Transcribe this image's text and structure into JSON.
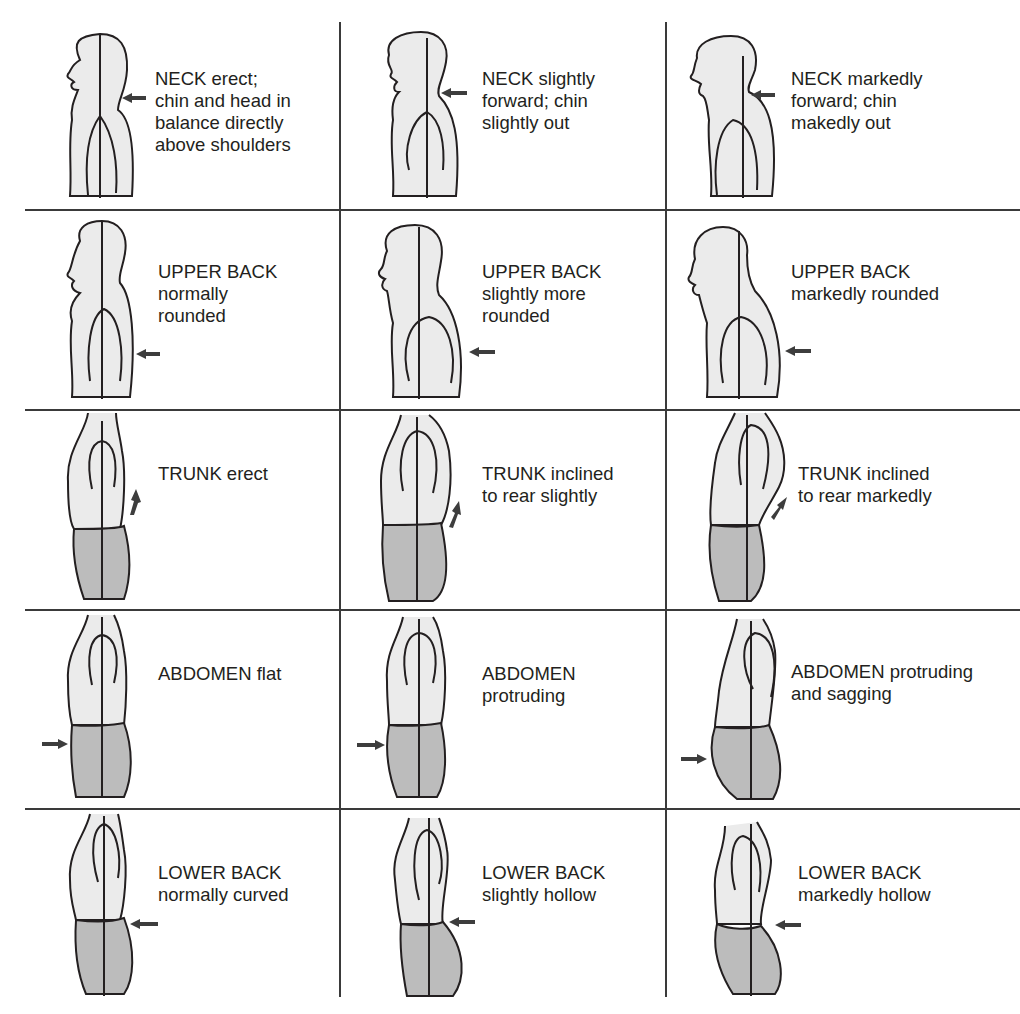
{
  "figure": {
    "rows": [
      {
        "region": "NECK",
        "cells": [
          {
            "label": "NECK erect;\nchin and head in\nbalance directly\nabove shoulders",
            "severity": "normal"
          },
          {
            "label": "NECK slightly\nforward; chin\nslightly out",
            "severity": "slight"
          },
          {
            "label": "NECK markedly\nforward; chin\nmakedly out",
            "severity": "marked"
          }
        ]
      },
      {
        "region": "UPPER BACK",
        "cells": [
          {
            "label": "UPPER BACK\nnormally\nrounded",
            "severity": "normal"
          },
          {
            "label": "UPPER BACK\nslightly more\nrounded",
            "severity": "slight"
          },
          {
            "label": "UPPER BACK\nmarkedly rounded",
            "severity": "marked"
          }
        ]
      },
      {
        "region": "TRUNK",
        "cells": [
          {
            "label": "TRUNK erect",
            "severity": "normal"
          },
          {
            "label": "TRUNK inclined\nto rear slightly",
            "severity": "slight"
          },
          {
            "label": "TRUNK inclined\nto rear markedly",
            "severity": "marked"
          }
        ]
      },
      {
        "region": "ABDOMEN",
        "cells": [
          {
            "label": "ABDOMEN flat",
            "severity": "normal"
          },
          {
            "label": "ABDOMEN\nprotruding",
            "severity": "slight"
          },
          {
            "label": "ABDOMEN protruding\nand sagging",
            "severity": "marked"
          }
        ]
      },
      {
        "region": "LOWER BACK",
        "cells": [
          {
            "label": "LOWER BACK\nnormally curved",
            "severity": "normal"
          },
          {
            "label": "LOWER BACK\nslightly hollow",
            "severity": "slight"
          },
          {
            "label": "LOWER BACK\nmarkedly hollow",
            "severity": "marked"
          }
        ]
      }
    ],
    "colors": {
      "outline": "#231f20",
      "body_fill": "#ebebeb",
      "pelvis_fill": "#bcbcbc",
      "arrow": "#3d3d3d",
      "grid_line": "#3a3a3a"
    }
  }
}
